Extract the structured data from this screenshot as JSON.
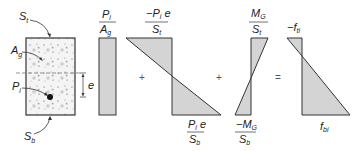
{
  "diagram": {
    "colors": {
      "fill": "#d4d4d4",
      "stroke": "#333333",
      "concrete": "#f3f3f3"
    },
    "section": {
      "label_top": {
        "main": "S",
        "sub": "t"
      },
      "label_bottom": {
        "main": "S",
        "sub": "b"
      },
      "label_area": {
        "main": "A",
        "sub": "g"
      },
      "label_force": {
        "main": "P",
        "sub": "i"
      },
      "label_eccentricity": "e"
    },
    "terms": [
      {
        "id": "axial",
        "numerator": {
          "main": "P",
          "sub": "i"
        },
        "denominator": {
          "main": "A",
          "sub": "g"
        }
      },
      {
        "id": "prestress-moment",
        "top": {
          "numerator_prefix": "−",
          "numerator_main": "P",
          "numerator_sub": "i",
          "numerator_suffix": " e",
          "denominator_main": "S",
          "denominator_sub": "t"
        },
        "bottom": {
          "numerator_main": "P",
          "numerator_sub": "i",
          "numerator_suffix": " e",
          "denominator_main": "S",
          "denominator_sub": "b"
        }
      },
      {
        "id": "gravity-moment",
        "top": {
          "numerator_main": "M",
          "numerator_sub": "G",
          "denominator_main": "S",
          "denominator_sub": "t"
        },
        "bottom": {
          "numerator_prefix": "−",
          "numerator_main": "M",
          "numerator_sub": "G",
          "denominator_main": "S",
          "denominator_sub": "b"
        }
      },
      {
        "id": "resultant",
        "top": {
          "prefix": "−",
          "main": "f",
          "sub": "ti"
        },
        "bottom": {
          "main": "f",
          "sub": "bi"
        }
      }
    ],
    "operators": [
      "+",
      "+",
      "="
    ]
  }
}
